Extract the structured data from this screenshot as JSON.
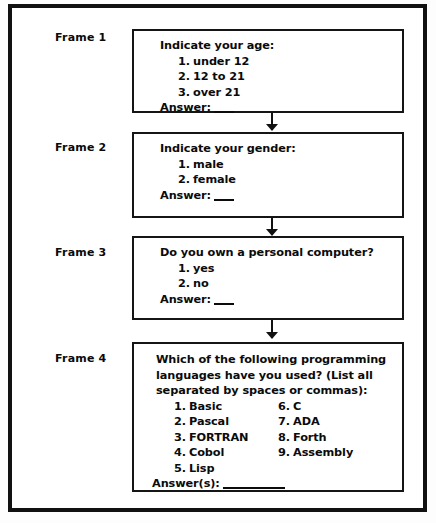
{
  "document": {
    "type": "flowchart",
    "title": "Questionnaire frame sequence",
    "background_color": "#ffffff",
    "ink_color": "#111111"
  },
  "frames": [
    {
      "label": "Frame 1",
      "question": "Indicate your age:",
      "options": [
        {
          "num": "1.",
          "text": "under 12"
        },
        {
          "num": "2.",
          "text": "12 to 21"
        },
        {
          "num": "3.",
          "text": "over 21"
        }
      ],
      "answer_label": "Answer:",
      "answer_blank": "short"
    },
    {
      "label": "Frame 2",
      "question": "Indicate your gender:",
      "options": [
        {
          "num": "1.",
          "text": "male"
        },
        {
          "num": "2.",
          "text": "female"
        }
      ],
      "answer_label": "Answer:",
      "answer_blank": "short"
    },
    {
      "label": "Frame 3",
      "question": "Do you own a personal computer?",
      "options": [
        {
          "num": "1.",
          "text": "yes"
        },
        {
          "num": "2.",
          "text": "no"
        }
      ],
      "answer_label": "Answer:",
      "answer_blank": "short"
    },
    {
      "label": "Frame 4",
      "question": "Which of the following programming languages have you used? (List all separated by spaces or commas):",
      "options_column_left": [
        {
          "num": "1.",
          "text": "Basic"
        },
        {
          "num": "2.",
          "text": "Pascal"
        },
        {
          "num": "3.",
          "text": "FORTRAN"
        },
        {
          "num": "4.",
          "text": "Cobol"
        },
        {
          "num": "5.",
          "text": "Lisp"
        }
      ],
      "options_column_right": [
        {
          "num": "6.",
          "text": "C"
        },
        {
          "num": "7.",
          "text": "ADA"
        },
        {
          "num": "8.",
          "text": "Forth"
        },
        {
          "num": "9.",
          "text": "Assembly"
        }
      ],
      "answer_label": "Answer(s):",
      "answer_blank": "long"
    }
  ],
  "connectors": [
    {
      "name": "arrow-frame1-to-frame2"
    },
    {
      "name": "arrow-frame2-to-frame3"
    },
    {
      "name": "arrow-frame3-to-frame4"
    }
  ]
}
